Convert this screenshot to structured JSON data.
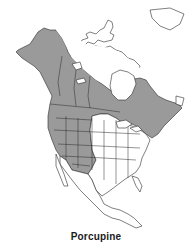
{
  "map": {
    "title": "Porcupine",
    "region": "North America",
    "legend": {
      "range_color": "#9a9a9a",
      "non_range_color": "#ffffff",
      "outline_color": "#2a2a2a"
    }
  }
}
